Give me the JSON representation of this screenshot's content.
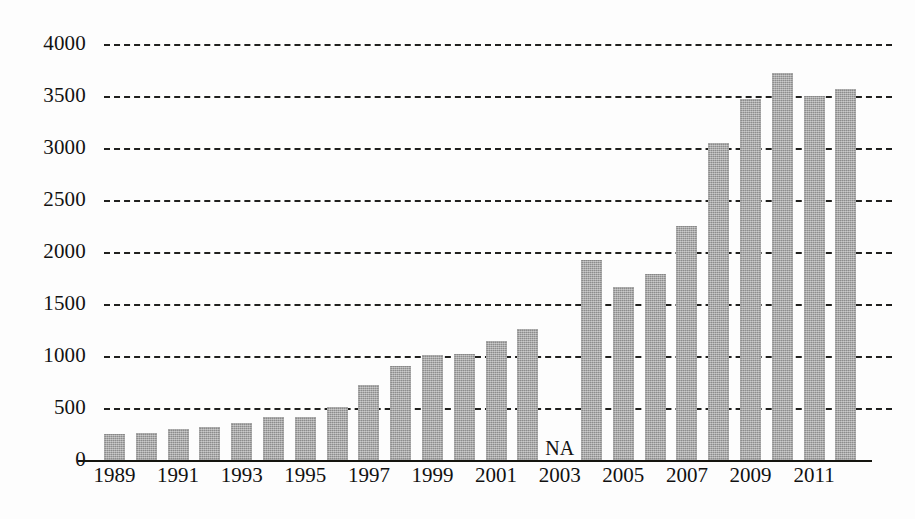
{
  "chart_data": {
    "type": "bar",
    "title": "",
    "subtitle": "",
    "xlabel": "",
    "ylabel": "",
    "grid": true,
    "legend": null,
    "ylim": [
      0,
      4000
    ],
    "ytick_labels": [
      "0",
      "500",
      "1000",
      "1500",
      "2000",
      "2500",
      "3000",
      "3500",
      "4000"
    ],
    "ytick_values": [
      0,
      500,
      1000,
      1500,
      2000,
      2500,
      3000,
      3500,
      4000
    ],
    "xtick_labels": [
      "1989",
      "1991",
      "1993",
      "1995",
      "1997",
      "1999",
      "2001",
      "2003",
      "2005",
      "2007",
      "2009",
      "2011"
    ],
    "categories": [
      "1989",
      "1990",
      "1991",
      "1992",
      "1993",
      "1994",
      "1995",
      "1996",
      "1997",
      "1998",
      "1999",
      "2000",
      "2001",
      "2002",
      "2003",
      "2004",
      "2005",
      "2006",
      "2007",
      "2008",
      "2009",
      "2010",
      "2011",
      "2012"
    ],
    "values": [
      250,
      260,
      300,
      320,
      360,
      410,
      410,
      510,
      720,
      900,
      1005,
      1015,
      1145,
      1260,
      null,
      1920,
      1660,
      1790,
      2250,
      3050,
      3470,
      3720,
      3500,
      3570
    ],
    "missing_label": "NA",
    "missing_category": "2003",
    "bar_color": "#9d9d9d",
    "gridline_color": "#20201e",
    "axis_color": "#15150f",
    "background_color": "#ffffff"
  }
}
